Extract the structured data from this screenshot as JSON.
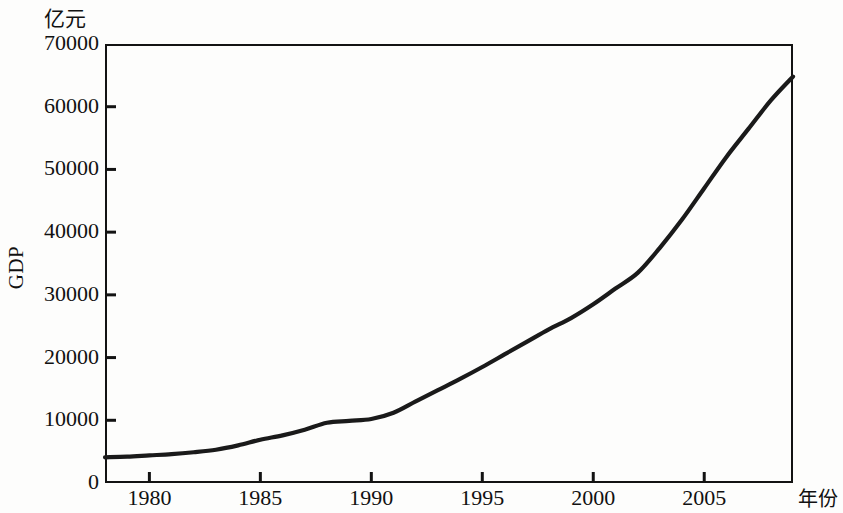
{
  "chart_data": {
    "type": "line",
    "title": "",
    "subtitle": "",
    "xlabel": "年份",
    "ylabel": "GDP",
    "yunit": "亿元",
    "xlim": [
      1978,
      2009
    ],
    "ylim": [
      0,
      70000
    ],
    "grid": false,
    "legend": null,
    "annotations": [],
    "xticks": [
      1980,
      1985,
      1990,
      1995,
      2000,
      2005
    ],
    "xtick_labels": [
      "1980",
      "1985",
      "1990",
      "1995",
      "2000",
      "2005"
    ],
    "yticks": [
      0,
      10000,
      20000,
      30000,
      40000,
      50000,
      60000,
      70000
    ],
    "ytick_labels": [
      "0",
      "10000",
      "20000",
      "30000",
      "40000",
      "50000",
      "60000",
      "70000"
    ],
    "series": [
      {
        "name": "GDP",
        "color": "#1a1a1a",
        "x": [
          1978,
          1979,
          1980,
          1981,
          1982,
          1983,
          1984,
          1985,
          1986,
          1987,
          1988,
          1989,
          1990,
          1991,
          1992,
          1993,
          1994,
          1995,
          1996,
          1997,
          1998,
          1999,
          2000,
          2001,
          2002,
          2003,
          2004,
          2005,
          2006,
          2007,
          2008,
          2009
        ],
        "values": [
          4100,
          4200,
          4400,
          4600,
          4900,
          5300,
          6000,
          6900,
          7600,
          8500,
          9600,
          9900,
          10200,
          11200,
          13000,
          14800,
          16600,
          18500,
          20500,
          22500,
          24500,
          26300,
          28500,
          31000,
          33500,
          37500,
          42000,
          47000,
          52000,
          56500,
          61000,
          64800
        ]
      }
    ]
  },
  "figure": {
    "unit_label": "亿元",
    "y_axis_title": "GDP",
    "x_axis_title": "年份"
  }
}
